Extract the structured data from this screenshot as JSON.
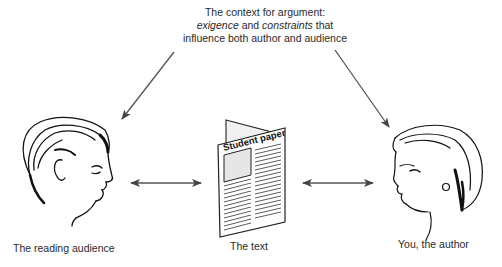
{
  "context": {
    "line1": "The context for argument:",
    "line2_italic_a": "exigence",
    "line2_mid": " and ",
    "line2_italic_b": "constraints",
    "line2_end": " that",
    "line3": "influence both author and audience"
  },
  "nodes": {
    "audience": {
      "label": "The reading audience",
      "icon": "male-profile-head"
    },
    "text": {
      "label": "The text",
      "icon": "newspaper",
      "paper_title": "Student paper"
    },
    "author": {
      "label": "You, the author",
      "icon": "female-profile-head"
    }
  },
  "edges": [
    {
      "from": "context",
      "to": "audience",
      "type": "arrow"
    },
    {
      "from": "context",
      "to": "author",
      "type": "arrow"
    },
    {
      "from": "audience",
      "to": "text",
      "type": "double-arrow"
    },
    {
      "from": "text",
      "to": "author",
      "type": "double-arrow"
    }
  ],
  "colors": {
    "arrow": "#555555",
    "line": "#111111",
    "photo": "#e6e6e6",
    "back_page": "#f0f0f0"
  }
}
